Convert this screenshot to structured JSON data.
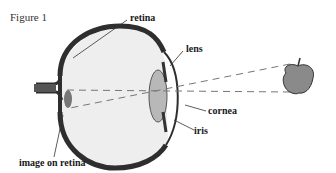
{
  "figure": {
    "title": "Figure 1",
    "labels": {
      "retina": "retina",
      "lens": "lens",
      "cornea": "cornea",
      "iris": "iris",
      "image_on_retina": "image on retina"
    }
  },
  "colors": {
    "wall": "#2e2e2e",
    "interior": "#eeeeee",
    "lens": "#b8b8b8",
    "apple": "#8a8a8a",
    "dash": "#777777"
  }
}
